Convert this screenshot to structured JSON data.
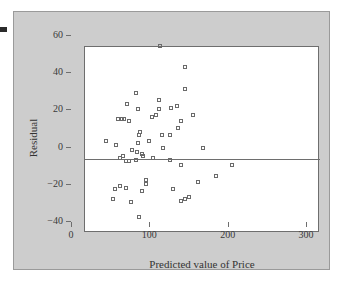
{
  "chart_data": {
    "type": "scatter",
    "title": "",
    "xlabel": "Predicted value of Price",
    "ylabel": "Residual",
    "xlim": [
      0,
      300
    ],
    "ylim": [
      -40,
      60
    ],
    "xticks": [
      0,
      100,
      200,
      300
    ],
    "yticks": [
      -40,
      -20,
      0,
      20,
      40,
      60
    ],
    "xticklabels": [
      "0",
      "100",
      "200",
      "300"
    ],
    "yticklabels": [
      "-40",
      "-20",
      "0",
      "20",
      "40",
      "60"
    ],
    "grid": false,
    "legend": null,
    "reference_lines": [
      {
        "axis": "y",
        "value": 0
      }
    ],
    "marker": "open-square",
    "marker_color": "#6a6a6a",
    "background_color": "#cdcdcd",
    "plot_background_color": "#ffffff",
    "points": [
      {
        "x": 45,
        "y": 3
      },
      {
        "x": 58,
        "y": 1
      },
      {
        "x": 60,
        "y": 15
      },
      {
        "x": 65,
        "y": 15
      },
      {
        "x": 68,
        "y": 15
      },
      {
        "x": 72,
        "y": 23
      },
      {
        "x": 74,
        "y": 14
      },
      {
        "x": 83,
        "y": 29
      },
      {
        "x": 85,
        "y": 20
      },
      {
        "x": 88,
        "y": 8
      },
      {
        "x": 87,
        "y": 6
      },
      {
        "x": 86,
        "y": 2
      },
      {
        "x": 100,
        "y": 3
      },
      {
        "x": 104,
        "y": 16
      },
      {
        "x": 108,
        "y": 17
      },
      {
        "x": 112,
        "y": 25
      },
      {
        "x": 112,
        "y": 20
      },
      {
        "x": 116,
        "y": 6
      },
      {
        "x": 126,
        "y": 6
      },
      {
        "x": 128,
        "y": 21
      },
      {
        "x": 135,
        "y": 22
      },
      {
        "x": 137,
        "y": 10
      },
      {
        "x": 141,
        "y": 14
      },
      {
        "x": 145,
        "y": 31
      },
      {
        "x": 146,
        "y": 43
      },
      {
        "x": 114,
        "y": 54
      },
      {
        "x": 156,
        "y": 17
      },
      {
        "x": 66,
        "y": -5
      },
      {
        "x": 63,
        "y": -6
      },
      {
        "x": 70,
        "y": -8
      },
      {
        "x": 74,
        "y": -8
      },
      {
        "x": 78,
        "y": -2
      },
      {
        "x": 84,
        "y": -3
      },
      {
        "x": 83,
        "y": -7
      },
      {
        "x": 90,
        "y": -4
      },
      {
        "x": 92,
        "y": -5
      },
      {
        "x": 105,
        "y": -6
      },
      {
        "x": 118,
        "y": -1
      },
      {
        "x": 126,
        "y": -7
      },
      {
        "x": 140,
        "y": -10
      },
      {
        "x": 168,
        "y": -1
      },
      {
        "x": 53,
        "y": -28
      },
      {
        "x": 56,
        "y": -23
      },
      {
        "x": 62,
        "y": -21
      },
      {
        "x": 70,
        "y": -22
      },
      {
        "x": 76,
        "y": -30
      },
      {
        "x": 90,
        "y": -24
      },
      {
        "x": 96,
        "y": -18
      },
      {
        "x": 96,
        "y": -20
      },
      {
        "x": 87,
        "y": -38
      },
      {
        "x": 130,
        "y": -23
      },
      {
        "x": 141,
        "y": -29
      },
      {
        "x": 145,
        "y": -28
      },
      {
        "x": 150,
        "y": -27
      },
      {
        "x": 162,
        "y": -19
      },
      {
        "x": 185,
        "y": -16
      },
      {
        "x": 205,
        "y": -10
      }
    ]
  },
  "axis": {
    "x_title": "Predicted value of Price",
    "y_title": "Residual"
  }
}
